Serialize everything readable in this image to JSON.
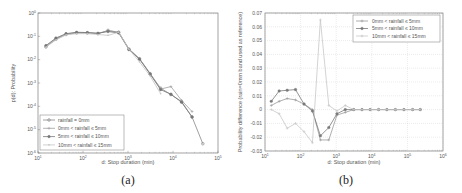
{
  "chart_data": [
    {
      "type": "line",
      "panel": "(a)",
      "xlabel": "d: Stop duration (min)",
      "ylabel": "p(d): Probability",
      "xscale": "log",
      "yscale": "log",
      "xlim": [
        10,
        100000
      ],
      "ylim": [
        1e-06,
        1
      ],
      "x_ticks": [
        "10^1",
        "10^2",
        "10^3",
        "10^4",
        "10^5"
      ],
      "y_ticks": [
        "10^0",
        "10^-1",
        "10^-2",
        "10^-3",
        "10^-4",
        "10^-5",
        "10^-6"
      ],
      "legend_position": "lower left",
      "grid": false,
      "x": [
        15,
        25,
        42,
        72,
        125,
        215,
        360,
        620,
        1050,
        1800,
        3100,
        5300,
        9000,
        15500,
        26500,
        46000
      ],
      "series": [
        {
          "name": "rainfall = 0mm",
          "values": [
            0.035,
            0.075,
            0.12,
            0.14,
            0.14,
            0.13,
            0.18,
            0.15,
            0.028,
            0.011,
            0.0025,
            0.0006,
            0.00032,
            0.00016,
            3.5e-05,
            2.5e-06
          ]
        },
        {
          "name": "0mm < rainfall ≤ 5mm",
          "values": [
            0.038,
            0.08,
            0.125,
            0.145,
            0.145,
            0.135,
            0.17,
            0.15,
            0.029,
            0.011,
            0.0026,
            0.00055,
            0.0007,
            0.00018,
            6e-05,
            null
          ]
        },
        {
          "name": "5mm < rainfall ≤ 10mm",
          "values": [
            0.04,
            0.085,
            0.13,
            0.15,
            0.145,
            0.135,
            0.16,
            0.14,
            0.027,
            0.0105,
            0.0024,
            0.00052,
            0.00033,
            0.00015,
            3.5e-05,
            null
          ]
        },
        {
          "name": "10mm < rainfall ≤ 15mm",
          "values": [
            0.035,
            0.07,
            0.115,
            0.13,
            0.13,
            0.12,
            0.11,
            0.15,
            0.028,
            0.008,
            0.002,
            0.00035,
            null,
            null,
            null,
            null
          ]
        }
      ],
      "caption": "(a)"
    },
    {
      "type": "line",
      "panel": "(b)",
      "xlabel": "d: Stop duration (min)",
      "ylabel": "Probability difference (rain=0mm band used as reference)",
      "xscale": "log",
      "xlim": [
        10,
        1000000
      ],
      "ylim": [
        -0.03,
        0.07
      ],
      "x_ticks": [
        "10^1",
        "10^2",
        "10^3",
        "10^4",
        "10^5",
        "10^6"
      ],
      "y_ticks": [
        "0.07",
        "0.06",
        "0.05",
        "0.04",
        "0.03",
        "0.02",
        "0.01",
        "0",
        "-0.01",
        "-0.02",
        "-0.03"
      ],
      "legend_position": "upper right",
      "grid": true,
      "x": [
        15,
        25,
        42,
        72,
        125,
        215,
        360,
        620,
        1050,
        1800,
        3100,
        5300,
        9000,
        15500,
        26500,
        46000,
        80000,
        140000,
        230000
      ],
      "series": [
        {
          "name": "0mm < rainfall ≤ 5mm",
          "values": [
            0.003,
            0.006,
            0.008,
            0.007,
            0.004,
            0.0,
            -0.022,
            -0.022,
            -0.004,
            -0.002,
            0.0,
            0.0,
            0.0,
            0.0,
            0.0,
            0.0,
            0.0,
            0.0,
            0.0
          ]
        },
        {
          "name": "5mm < rainfall ≤ 10mm",
          "values": [
            0.006,
            0.0135,
            0.014,
            0.0145,
            0.004,
            -0.001,
            -0.019,
            -0.013,
            -0.003,
            0.0,
            0.0,
            0.0,
            0.0,
            0.0,
            0.0,
            0.0,
            0.0,
            0.0,
            0.0
          ]
        },
        {
          "name": "10mm < rainfall ≤ 15mm",
          "values": [
            0.0,
            -0.003,
            -0.0135,
            -0.01,
            -0.016,
            -0.024,
            0.065,
            0.003,
            -0.001,
            0.003,
            0.0,
            0.0,
            0.0,
            0.0,
            0.0,
            0.0,
            0.0,
            0.0,
            0.0
          ]
        }
      ],
      "caption": "(b)"
    }
  ],
  "labels": {
    "a_xlabel": "d: Stop duration (min)",
    "a_ylabel": "p(d): Probability",
    "b_xlabel": "d: Stop duration (min)",
    "b_ylabel": "Probability difference (rain=0mm band used as reference)",
    "a_caption": "(a)",
    "b_caption": "(b)"
  }
}
